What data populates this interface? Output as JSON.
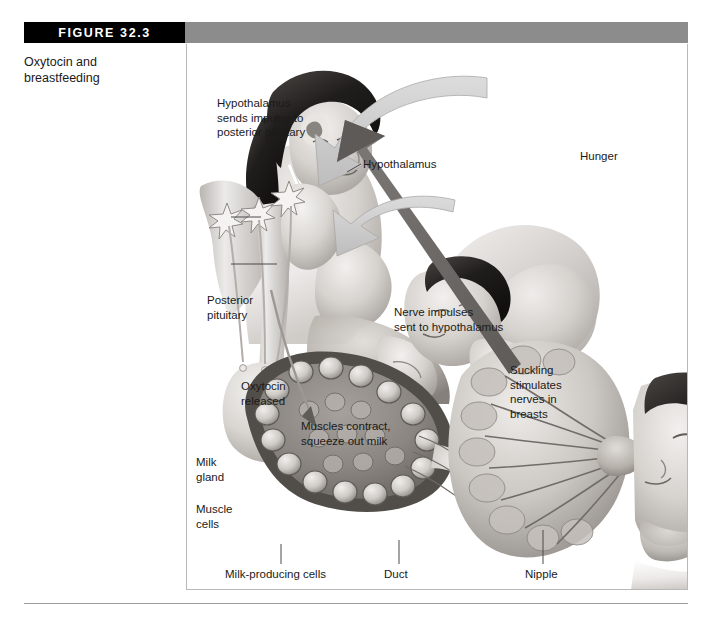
{
  "figure": {
    "tag": "FIGURE 32.3",
    "caption": "Oxytocin and\nbreastfeeding"
  },
  "panel": {
    "labels": {
      "hypothalamus_impulse": "Hypothalamus\nsends impulse to\nposterior pituitary",
      "hypothalamus": "Hypothalamus",
      "hunger": "Hunger",
      "posterior_pituitary": "Posterior\npituitary",
      "nerve_impulses": "Nerve impulses\nsent to hypothalamus",
      "suckling": "Suckling\nstimulates\nnerves in\nbreasts",
      "oxytocin_released": "Oxytocin\nreleased",
      "muscles_contract": "Muscles contract,\nsqueeze out milk",
      "milk_gland": "Milk\ngland",
      "muscle_cells": "Muscle\ncells",
      "milk_producing_cells": "Milk-producing cells",
      "duct": "Duct",
      "nipple": "Nipple"
    },
    "illustrations": {
      "mother_baby": "mother-breastfeeding-baby-illustration",
      "brain_pituitary": "hypothalamus-posterior-pituitary-illustration",
      "milk_gland_section": "milk-gland-cross-section-illustration",
      "breast_suckling": "breast-ducts-baby-suckling-illustration"
    },
    "arrows": {
      "hypothalamus_to_pituitary": "light-gray-curved-arrow-down-left",
      "nerves_to_hypothalamus": "dark-gray-arrow-up-left",
      "breast_to_gland": "light-gray-curved-arrow-left"
    }
  },
  "colors": {
    "tag_background": "#000000",
    "tag_text": "#ffffff",
    "header_gray": "#8c8c8c",
    "panel_border": "#b8b8b8",
    "light_arrow": "#c9c9c9",
    "dark_arrow": "#6d6d6d",
    "text": "#1a1a1a"
  }
}
